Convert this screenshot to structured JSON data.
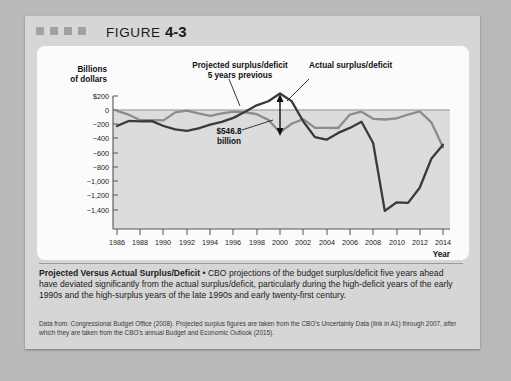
{
  "figure": {
    "label": "FIGURE ",
    "number": "4-3",
    "decor_squares": 4
  },
  "caption": {
    "title": "Projected Versus Actual Surplus/Deficit",
    "bullet": " • ",
    "body": "CBO projections of the budget surplus/deficit five years ahead have deviated significantly from the actual surplus/deficit, particularly during the high-deficit years of the early 1990s and the high-surplus years of the late 1990s and early twenty-first century."
  },
  "source": {
    "text": "Data from: Congressional Budget Office (2008). Projected surplus figures are taken from the CBO's Uncertainty Data (link in A1) through 2007, after which they are taken from the CBO's annual Budget and Economic Outlook (2015)."
  },
  "chart_data": {
    "type": "line",
    "title": "",
    "xlabel": "Year",
    "ylabel": "Billions of dollars",
    "ylabel_line1": "Billions",
    "ylabel_line2": "of dollars",
    "grid": false,
    "legend_position": "inline-annotation",
    "xlim": [
      1985,
      2014.6
    ],
    "ylim": [
      -1450,
      260
    ],
    "yticks": [
      200,
      0,
      -200,
      -400,
      -600,
      -800,
      -1000,
      -1200,
      -1400
    ],
    "ytick_labels": [
      "$200",
      "0",
      "−200",
      "−400",
      "−600",
      "−800",
      "−1,000",
      "−1,200",
      "−1,400"
    ],
    "xticks": [
      1986,
      1988,
      1990,
      1992,
      1994,
      1996,
      1998,
      2000,
      2002,
      2004,
      2006,
      2008,
      2010,
      2012,
      2014
    ],
    "xtick_labels": [
      "1986",
      "1988",
      "1990",
      "1992",
      "1994",
      "1996",
      "1998",
      "2000",
      "2002",
      "2004",
      "2006",
      "2008",
      "2010",
      "2012",
      "2014"
    ],
    "x": [
      1986,
      1987,
      1988,
      1989,
      1990,
      1991,
      1992,
      1993,
      1994,
      1995,
      1996,
      1997,
      1998,
      1999,
      2000,
      2001,
      2002,
      2003,
      2004,
      2005,
      2006,
      2007,
      2008,
      2009,
      2010,
      2011,
      2012,
      2013,
      2014
    ],
    "series": [
      {
        "name": "Actual surplus/deficit",
        "color": "#3a3a3a",
        "values": [
          -221,
          -150,
          -155,
          -152,
          -221,
          -269,
          -290,
          -255,
          -203,
          -164,
          -107,
          -22,
          69,
          126,
          236,
          128,
          -158,
          -378,
          -413,
          -318,
          -248,
          -161,
          -459,
          -1413,
          -1294,
          -1300,
          -1087,
          -680,
          -485
        ]
      },
      {
        "name": "Projected surplus/deficit 5 years previous",
        "color": "#8c8c8c",
        "values": [
          -8,
          -62,
          -140,
          -140,
          -142,
          -30,
          -5,
          -45,
          -80,
          -45,
          -20,
          -28,
          -55,
          -135,
          -310,
          -190,
          -125,
          -247,
          -248,
          -249,
          -60,
          -20,
          -120,
          -130,
          -115,
          -60,
          -15,
          -170,
          -520
        ]
      }
    ],
    "annotations": [
      {
        "name": "projected-label",
        "text_line1": "Projected surplus/deficit",
        "text_line2": "5 years previous"
      },
      {
        "name": "actual-label",
        "text_line1": "Actual surplus/deficit"
      },
      {
        "name": "gap-callout",
        "text_line1": "$546.8",
        "text_line2": "billion",
        "year": 2000
      }
    ]
  }
}
